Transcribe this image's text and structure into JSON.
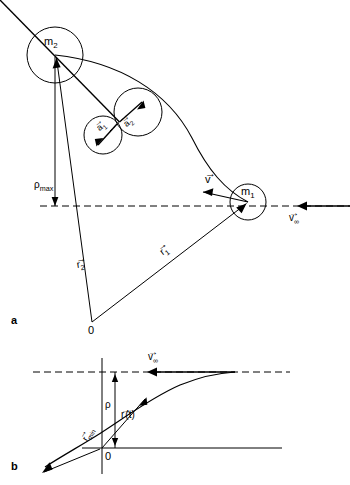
{
  "figure": {
    "type": "diagram",
    "panels": [
      {
        "letter": "a",
        "letter_pos": [
          14,
          322
        ],
        "labels": {
          "mass2": "m",
          "mass2_sub": "2",
          "mass1": "m",
          "mass1_sub": "1",
          "accel1": "a",
          "accel1_sub": "1",
          "accel2": "a",
          "accel2_sub": "2",
          "velocity": "v",
          "velocity_inf": "v",
          "velocity_inf_sub": "∞",
          "rho_max": "ρ",
          "rho_max_sub": "max",
          "r1": "r",
          "r1_sub": "1",
          "r2": "r",
          "r2_sub": "2",
          "origin": "0"
        }
      },
      {
        "letter": "b",
        "letter_pos": [
          14,
          468
        ],
        "labels": {
          "velocity_inf": "v",
          "velocity_inf_sub": "∞",
          "rho": "ρ",
          "r_of_t": "r",
          "r_of_t_arg": "(t)",
          "r_min": "r",
          "r_min_sub": "min",
          "origin": "0"
        }
      }
    ],
    "colors": {
      "stroke": "#000000",
      "background": "#ffffff"
    },
    "geometry": {
      "panel_a": {
        "circle_m2": {
          "cx": 55,
          "cy": 55,
          "r": 28
        },
        "circle_mid_upper": {
          "cx": 138,
          "cy": 112,
          "r": 24
        },
        "circle_mid_lower": {
          "cx": 103,
          "cy": 135,
          "r": 19
        },
        "circle_m1": {
          "cx": 248,
          "cy": 202,
          "r": 18
        },
        "asymptote_y": 206,
        "origin": [
          92,
          322
        ]
      },
      "panel_b": {
        "asymptote_y": 372,
        "x_axis_y": 448,
        "y_axis_x": 102,
        "origin": [
          102,
          448
        ]
      }
    }
  }
}
